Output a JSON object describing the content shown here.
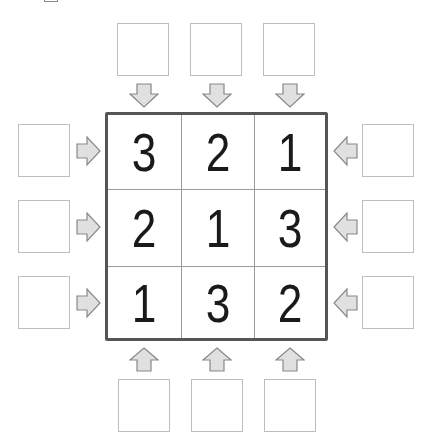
{
  "puzzle": {
    "type": "skyscraper-style number grid",
    "size": 3,
    "grid": [
      [
        "3",
        "2",
        "1"
      ],
      [
        "2",
        "1",
        "3"
      ],
      [
        "1",
        "3",
        "2"
      ]
    ],
    "clues": {
      "top": [
        "",
        "",
        ""
      ],
      "bottom": [
        "",
        "",
        ""
      ],
      "left": [
        "",
        "",
        ""
      ],
      "right": [
        "",
        "",
        ""
      ]
    },
    "arrows": {
      "top": "arrow-down-icon",
      "bottom": "arrow-up-icon",
      "left": "arrow-right-icon",
      "right": "arrow-left-icon"
    }
  },
  "colors": {
    "arrow_fill": "#e0e0e0",
    "arrow_stroke": "#888888",
    "grid_border": "#555555",
    "cell_line": "#9a9a9a",
    "digit": "#1a1a1a",
    "box_border": "#bdbdbd"
  }
}
